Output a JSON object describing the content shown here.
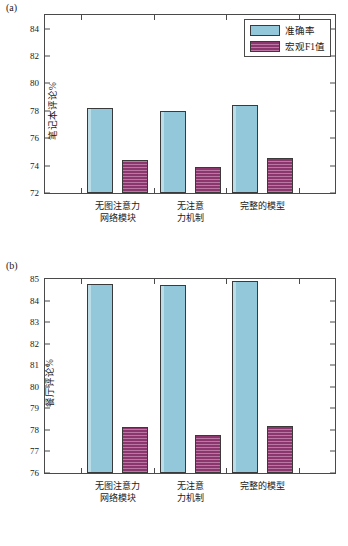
{
  "figure": {
    "panel_a_tag": "(a)",
    "panel_b_tag": "(b)"
  },
  "legend": {
    "position": "top-right",
    "items": [
      {
        "label": "准确率",
        "color": "#92c8da",
        "pattern": "solid"
      },
      {
        "label": "宏观F1值",
        "color": "#9e3d7c",
        "pattern": "horizontal-hatch"
      }
    ]
  },
  "chart_data": [
    {
      "type": "bar",
      "panel": "(a)",
      "title": "",
      "xlabel": "",
      "ylabel": "笔记本评论%",
      "ylim": [
        72,
        85
      ],
      "yticks": [
        72,
        74,
        76,
        78,
        80,
        82,
        84
      ],
      "ytick_labels": [
        "72",
        "74",
        "76",
        "78",
        "80",
        "82",
        "84"
      ],
      "grid": false,
      "categories": [
        "无图注意力\n网络模块",
        "无注意力\n力机制",
        "完整的模型"
      ],
      "category_lines": [
        [
          "无图注意力",
          "网络模块"
        ],
        [
          "无注意意",
          "力机制"
        ],
        [
          "完整的模型",
          ""
        ]
      ],
      "series": [
        {
          "name": "准确率",
          "color": "#92c8da",
          "values": [
            78.2,
            77.98,
            78.45
          ]
        },
        {
          "name": "宏观F1值",
          "color": "#9e3d7c",
          "values": [
            74.38,
            73.88,
            74.57
          ]
        }
      ]
    },
    {
      "type": "bar",
      "panel": "(b)",
      "title": "",
      "xlabel": "",
      "ylabel": "餐厅评论%",
      "ylim": [
        76,
        85
      ],
      "yticks": [
        76,
        77,
        78,
        79,
        80,
        81,
        82,
        83,
        84,
        85
      ],
      "ytick_labels": [
        "76",
        "77",
        "78",
        "79",
        "80",
        "81",
        "82",
        "83",
        "84",
        "85"
      ],
      "grid": false,
      "categories": [
        "无图注意力\n网络模块",
        "无注意力\n力机制",
        "完整的模型"
      ],
      "category_lines": [
        [
          "无图注意力",
          "网络模块"
        ],
        [
          "无注意意",
          "力机制"
        ],
        [
          "完整的模型",
          ""
        ]
      ],
      "series": [
        {
          "name": "准确率",
          "color": "#92c8da",
          "values": [
            84.77,
            84.7,
            84.9
          ]
        },
        {
          "name": "宏观F1值",
          "color": "#9e3d7c",
          "values": [
            78.13,
            77.75,
            78.2
          ]
        }
      ]
    }
  ],
  "xlabels": {
    "cat1_line1": "无图注意力",
    "cat1_line2": "网络模块",
    "cat2_line1": "无注意",
    "cat2_line2": "力机制",
    "cat3_line1": "完整的模型",
    "cat3_line2": ""
  }
}
